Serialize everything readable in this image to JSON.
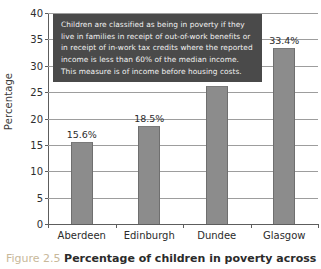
{
  "figure": {
    "caption_number": "Figure 2.5",
    "caption_text": "Percentage of children in poverty across four"
  },
  "annotation": {
    "text": "Children are classified as being in poverty if they live in families in receipt of out-of-work benefits or in receipt of in-work tax credits where the reported income is less than 60% of the median income. This measure is of income before housing costs.",
    "background": "#4a4a4a",
    "color": "#f2f2f2"
  },
  "chart_data": {
    "type": "bar",
    "title": "",
    "xlabel": "",
    "ylabel": "Percentage",
    "categories": [
      "Aberdeen",
      "Edinburgh",
      "Dundee",
      "Glasgow"
    ],
    "values": [
      15.6,
      18.5,
      26.1,
      33.4
    ],
    "data_labels": [
      "15.6%",
      "18.5%",
      "26.1%",
      "33.4%"
    ],
    "ylim": [
      0,
      40
    ],
    "yticks": [
      0,
      5,
      10,
      15,
      20,
      25,
      30,
      35,
      40
    ],
    "ytick_labels": [
      "0",
      "5",
      "10",
      "15",
      "20",
      "25",
      "30",
      "35",
      "40"
    ],
    "grid": true,
    "legend": false,
    "bar_color": "#8c8c8c",
    "bar_edge_color": "#6f6f6f",
    "axis_color": "#5d5d5d",
    "grid_color": "#9d9d9d"
  }
}
